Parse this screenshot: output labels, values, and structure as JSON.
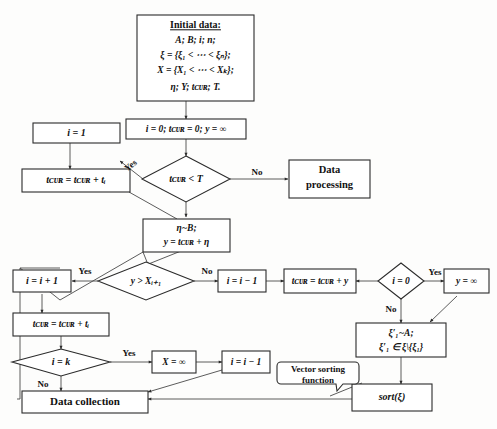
{
  "diagram": {
    "type": "flowchart",
    "title_node": {
      "heading": "Initial data:",
      "lines": [
        "A; B; i; n;",
        "ξ = {ξ₁ < ⋯ < ξₙ};",
        "X = {X₁ < ⋯ < Xₖ};",
        "η; Y; tᴄᴜʀ; T."
      ]
    },
    "nodes": {
      "init_vars": "i = 0; tᴄᴜʀ = 0; y = ∞",
      "i_eq_1": "i = 1",
      "tcur_plus_ti_top": "tᴄᴜʀ = tᴄᴜʀ + tᵢ",
      "decide_tcur_lt_T": "tᴄᴜʀ < T",
      "data_processing_l1": "Data",
      "data_processing_l2": "processing",
      "eta_b_l1": "η~B;",
      "eta_b_l2": "y = tᴄᴜʀ + η",
      "i_inc": "i = i + 1",
      "decide_y_gt_X": "y > Xᵢ₊₁",
      "i_dec_mid": "i = i − 1",
      "tcur_plus_y": "tᴄᴜʀ = tᴄᴜʀ + y",
      "decide_i_eq_0": "i = 0",
      "y_inf": "y = ∞",
      "xi_prime_l1": "ξ′₁~A;",
      "xi_prime_l2": "ξ′₁ ∈ ξ\\{ξ₁}",
      "tcur_plus_ti_low": "tᴄᴜʀ = tᴄᴜʀ + tᵢ",
      "decide_i_eq_k": "i = k",
      "x_inf": "X = ∞",
      "i_dec_low": "i = i − 1",
      "data_collection": "Data collection",
      "sort_xi": "sort(ξ)",
      "vector_note_l1": "Vector sorting",
      "vector_note_l2": "function"
    },
    "edge_labels": {
      "yes_tcur_lt_T": "Yes",
      "no_tcur_lt_T": "No",
      "yes_y_gt_X": "Yes",
      "no_y_gt_X": "No",
      "yes_i_eq_0": "Yes",
      "no_i_eq_0": "No",
      "yes_i_eq_k": "Yes",
      "no_i_eq_k": "No"
    },
    "colors": {
      "stroke": "#2b2b2b",
      "edge": "#4a4a4a",
      "fill": "#ffffff",
      "text": "#111111",
      "background": "#fdfdfc"
    }
  }
}
